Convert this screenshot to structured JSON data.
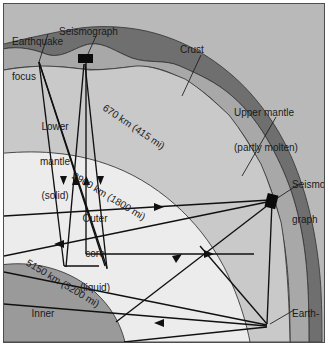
{
  "figure": {
    "kind": "cross-section-diagram",
    "frame_border_color": "#4d4d4d"
  },
  "colors": {
    "outside_background": "#b9b9b9",
    "mantle_lower": "#c9c9c9",
    "outer_core": "#ececec",
    "inner_core": "#9a9a9a",
    "upper_mantle": "#a8a8a8",
    "crust": "#6f6f6f",
    "ray_stroke": "#101010",
    "boundary_stroke": "#3a3a3a",
    "text": "#1a1a1a"
  },
  "labels": {
    "earthquake_focus_top": "Earthquake\nfocus",
    "earthquake_focus_top_line1": "Earthquake",
    "earthquake_focus_top_line2": "focus",
    "seismograph_top": "Seismograph",
    "crust": "Crust",
    "upper_mantle_line1": "Upper mantle",
    "upper_mantle_line2": "(partly molten)",
    "lower_mantle_line1": "Lower",
    "lower_mantle_line2": "mantle",
    "lower_mantle_line3": "(solid)",
    "outer_core_line1": "Outer",
    "outer_core_line2": "core",
    "outer_core_line3": "(liquid)",
    "inner_core_line1": "Inner",
    "inner_core_line2": "core",
    "inner_core_line3": "(solid)",
    "depth_670": "670 km (415 mi)",
    "depth_2900": "2900 km (1800 mi)",
    "depth_5150": "5150 km (3200 mi)",
    "seismograph_right_line1": "Seismo-",
    "seismograph_right_line2": "graph",
    "earthquake_focus_right_line1": "Earth-",
    "earthquake_focus_right_line2": "quake",
    "earthquake_focus_right_line3": "focus"
  },
  "depth_boundaries": [
    {
      "name": "670 km discontinuity",
      "km": 670,
      "mi": 415,
      "label": "670 km (415 mi)"
    },
    {
      "name": "core-mantle boundary",
      "km": 2900,
      "mi": 1800,
      "label": "2900 km (1800 mi)"
    },
    {
      "name": "inner core boundary",
      "km": 5150,
      "mi": 3200,
      "label": "5150 km (3200 mi)"
    }
  ],
  "layers": [
    {
      "name": "Crust",
      "label": "Crust",
      "state": ""
    },
    {
      "name": "Upper mantle",
      "label": "Upper mantle",
      "state": "(partly molten)"
    },
    {
      "name": "Lower mantle",
      "label": "Lower mantle",
      "state": "(solid)"
    },
    {
      "name": "Outer core",
      "label": "Outer core",
      "state": "(liquid)"
    },
    {
      "name": "Inner core",
      "label": "Inner core",
      "state": "(solid)"
    }
  ],
  "markers": [
    {
      "type": "earthquake-focus",
      "position": "upper-left-surface"
    },
    {
      "type": "seismograph",
      "position": "top-surface"
    },
    {
      "type": "seismograph",
      "position": "right-surface-upper"
    },
    {
      "type": "earthquake-focus",
      "position": "right-surface-lower"
    }
  ]
}
